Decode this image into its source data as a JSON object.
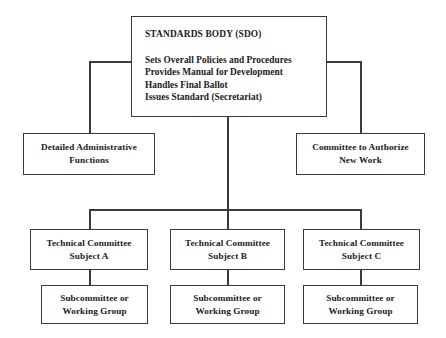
{
  "diagram": {
    "type": "organizational-chart",
    "background_color": "#ffffff",
    "line_color": "#3a3a3a",
    "text_color": "#1a1a1a"
  },
  "nodes": {
    "root": {
      "heading": "STANDARDS BODY (SDO)",
      "duties": [
        "Sets Overall Policies and Procedures",
        "Provides Manual for Development",
        "Handles Final Ballot",
        "Issues Standard (Secretariat)"
      ]
    },
    "admin": {
      "line1": "Detailed Administrative",
      "line2": "Functions"
    },
    "authorize": {
      "line1": "Committee to Authorize",
      "line2": "New Work"
    },
    "technical_committees": [
      {
        "line1": "Technical Committee",
        "line2": "Subject A"
      },
      {
        "line1": "Technical Committee",
        "line2": "Subject B"
      },
      {
        "line1": "Technical Committee",
        "line2": "Subject C"
      }
    ],
    "subcommittees": [
      {
        "line1": "Subcommittee or",
        "line2": "Working Group"
      },
      {
        "line1": "Subcommittee or",
        "line2": "Working Group"
      },
      {
        "line1": "Subcommittee or",
        "line2": "Working Group"
      }
    ]
  }
}
